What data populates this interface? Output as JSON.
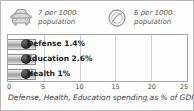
{
  "stats": [
    {
      "icon": "car-icon",
      "value_line": "7 per 1000",
      "unit_line": "population"
    },
    {
      "icon": "telephone-dial-icon",
      "value_line": "6 per 1000",
      "unit_line": "population"
    }
  ],
  "caption": "Defense, Health, Education spending as % of GDP",
  "chart_data": {
    "type": "bar",
    "orientation": "horizontal",
    "title": "",
    "subtitle": "",
    "xlabel": "",
    "ylabel": "",
    "categories": [
      "Defense",
      "Education",
      "Health"
    ],
    "values": [
      1.4,
      2.6,
      1.0
    ],
    "data_labels": [
      "Defense 1.4%",
      "Education 2.6%",
      "Health 1%"
    ],
    "xlim": [
      0,
      25
    ],
    "ticks": [
      0,
      5,
      10,
      15,
      20,
      25
    ],
    "tick_labels": [
      "0",
      "5",
      "10",
      "15",
      "20",
      "25"
    ],
    "grid": true,
    "legend": "none",
    "annotation": "Defense, Health, Education spending as % of GDP",
    "bar_color": "#9d9d9d",
    "bullet_color": "#2b2b2b",
    "grid_color": "#cfcfcf"
  }
}
